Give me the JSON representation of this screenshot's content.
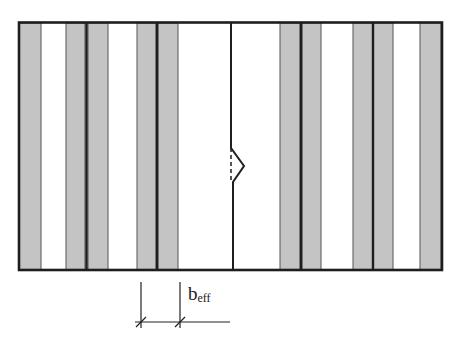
{
  "diagram": {
    "type": "effective-width-strip-diagram",
    "colors": {
      "stroke": "#1e1e1e",
      "strip_fill": "#c4c4c4",
      "background": "#ffffff"
    },
    "panel": {
      "x": 18,
      "y": 22,
      "width": 424,
      "height": 248
    },
    "grey_strips": [
      {
        "x": 19,
        "w": 22
      },
      {
        "x": 66,
        "w": 19
      },
      {
        "x": 88,
        "w": 20
      },
      {
        "x": 137,
        "w": 19
      },
      {
        "x": 158,
        "w": 20
      },
      {
        "x": 280,
        "w": 20
      },
      {
        "x": 302,
        "w": 19
      },
      {
        "x": 353,
        "w": 20
      },
      {
        "x": 373,
        "w": 20
      },
      {
        "x": 420,
        "w": 21
      }
    ],
    "heavy_lines_x": [
      19,
      86,
      157,
      300,
      372,
      442
    ],
    "crack": {
      "x": 231,
      "kink_top_y": 148,
      "kink_apex_x": 244,
      "kink_mid_y": 166,
      "kink_bottom_y": 182
    },
    "dimension": {
      "left_x": 141,
      "right_x": 180,
      "line_y": 322,
      "label_main": "b",
      "label_sub": "eff"
    }
  }
}
